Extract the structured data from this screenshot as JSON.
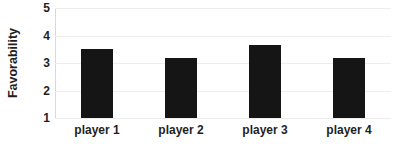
{
  "chart_data": {
    "type": "bar",
    "title": "",
    "xlabel": "",
    "ylabel": "Favorability",
    "categories": [
      "player 1",
      "player 2",
      "player 3",
      "player 4"
    ],
    "values": [
      3.5,
      3.2,
      3.65,
      3.2
    ],
    "ylim": [
      1,
      5
    ],
    "yticks": [
      1,
      2,
      3,
      4,
      5
    ],
    "ytick_labels": [
      "1",
      "2",
      "3",
      "4",
      "5"
    ],
    "grid": true,
    "grid_axis": "y",
    "legend": false,
    "legend_position": "none",
    "bar_color": "#151515",
    "gridline_color": "#ededed",
    "axis_color": "#cfcfcf",
    "background_color": "#ffffff",
    "text_color": "#1f1f1f"
  }
}
